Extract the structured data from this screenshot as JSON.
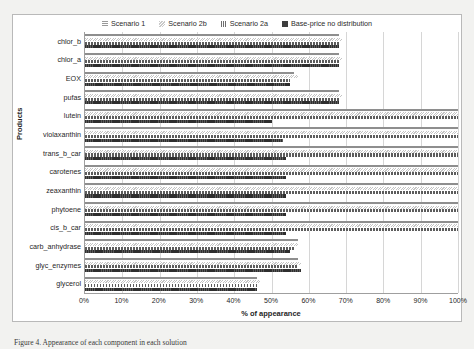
{
  "chart_data": {
    "type": "bar",
    "orientation": "horizontal",
    "title": "",
    "xlabel": "% of appearance",
    "ylabel": "Products",
    "xlim": [
      0,
      100
    ],
    "xticks": [
      "0%",
      "10%",
      "20%",
      "30%",
      "40%",
      "50%",
      "60%",
      "70%",
      "80%",
      "90%",
      "100%"
    ],
    "xtick_values": [
      0,
      10,
      20,
      30,
      40,
      50,
      60,
      70,
      80,
      90,
      100
    ],
    "grid": true,
    "legend_position": "top-center",
    "categories": [
      "chlor_b",
      "chlor_a",
      "EOX",
      "pufas",
      "lutein",
      "violaxanthin",
      "trans_b_car",
      "carotenes",
      "zeaxanthin",
      "phytoene",
      "cis_b_car",
      "carb_anhydrase",
      "glyc_enzymes",
      "glycerol"
    ],
    "series": [
      {
        "name": "Scenario 1",
        "values": [
          68,
          68,
          56,
          68,
          100,
          100,
          100,
          100,
          100,
          100,
          100,
          57,
          57,
          46
        ]
      },
      {
        "name": "Scenario 2b",
        "values": [
          69,
          69,
          57,
          69,
          100,
          100,
          100,
          100,
          100,
          100,
          100,
          57,
          58,
          47
        ]
      },
      {
        "name": "Scenario 2a",
        "values": [
          68,
          68,
          55,
          68,
          100,
          100,
          100,
          100,
          100,
          100,
          100,
          56,
          57,
          46
        ]
      },
      {
        "name": "Base-price no distribution",
        "values": [
          68,
          68,
          55,
          68,
          50,
          53,
          54,
          54,
          54,
          54,
          54,
          55,
          58,
          46
        ]
      }
    ]
  },
  "legend": {
    "items": [
      {
        "label": "Scenario 1",
        "swatch": "scenario-1-swatch-icon",
        "color": "#9a9a9a"
      },
      {
        "label": "Scenario 2b",
        "swatch": "scenario-2b-swatch-icon",
        "color": "#c9c9c9"
      },
      {
        "label": "Scenario 2a",
        "swatch": "scenario-2a-swatch-icon",
        "color": "#6e6e6e"
      },
      {
        "label": "Base-price no distribution",
        "swatch": "base-price-swatch-icon",
        "color": "#3d3d3d"
      }
    ]
  },
  "caption": {
    "text": "Figure 4. Appearance of each component in each solution"
  }
}
